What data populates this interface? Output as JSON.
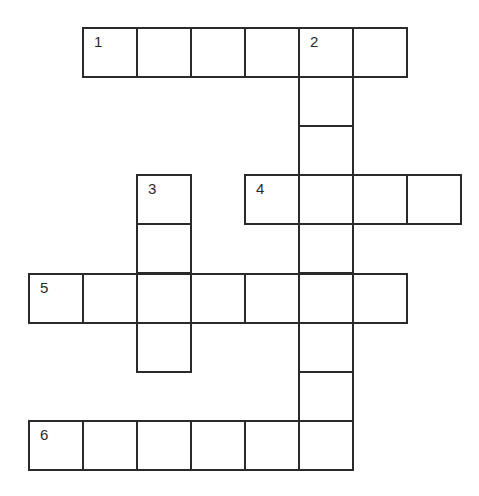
{
  "puzzle": {
    "type": "crossword",
    "layout": {
      "col_x": [
        28,
        82,
        136,
        190,
        244,
        298,
        352,
        406
      ],
      "row_y": [
        27,
        76,
        125,
        174,
        223,
        273,
        322,
        371,
        420
      ],
      "cell_w": 54,
      "cell_h": 49
    },
    "entries": [
      {
        "number": "1",
        "direction": "across",
        "row": 0,
        "col": 1,
        "length": 6
      },
      {
        "number": "2",
        "direction": "down",
        "row": 0,
        "col": 5,
        "length": 9
      },
      {
        "number": "3",
        "direction": "down",
        "row": 3,
        "col": 2,
        "length": 4
      },
      {
        "number": "4",
        "direction": "across",
        "row": 3,
        "col": 4,
        "length": 4
      },
      {
        "number": "5",
        "direction": "across",
        "row": 5,
        "col": 0,
        "length": 7
      },
      {
        "number": "6",
        "direction": "across",
        "row": 8,
        "col": 0,
        "length": 6
      }
    ],
    "cells": [
      {
        "row": 0,
        "col": 1,
        "number": "1",
        "value": ""
      },
      {
        "row": 0,
        "col": 2,
        "number": "",
        "value": ""
      },
      {
        "row": 0,
        "col": 3,
        "number": "",
        "value": ""
      },
      {
        "row": 0,
        "col": 4,
        "number": "",
        "value": ""
      },
      {
        "row": 0,
        "col": 5,
        "number": "2",
        "value": ""
      },
      {
        "row": 0,
        "col": 6,
        "number": "",
        "value": ""
      },
      {
        "row": 1,
        "col": 5,
        "number": "",
        "value": ""
      },
      {
        "row": 2,
        "col": 5,
        "number": "",
        "value": ""
      },
      {
        "row": 3,
        "col": 2,
        "number": "3",
        "value": ""
      },
      {
        "row": 3,
        "col": 4,
        "number": "4",
        "value": ""
      },
      {
        "row": 3,
        "col": 5,
        "number": "",
        "value": ""
      },
      {
        "row": 3,
        "col": 6,
        "number": "",
        "value": ""
      },
      {
        "row": 3,
        "col": 7,
        "number": "",
        "value": ""
      },
      {
        "row": 4,
        "col": 2,
        "number": "",
        "value": ""
      },
      {
        "row": 4,
        "col": 5,
        "number": "",
        "value": ""
      },
      {
        "row": 5,
        "col": 0,
        "number": "5",
        "value": ""
      },
      {
        "row": 5,
        "col": 1,
        "number": "",
        "value": ""
      },
      {
        "row": 5,
        "col": 2,
        "number": "",
        "value": ""
      },
      {
        "row": 5,
        "col": 3,
        "number": "",
        "value": ""
      },
      {
        "row": 5,
        "col": 4,
        "number": "",
        "value": ""
      },
      {
        "row": 5,
        "col": 5,
        "number": "",
        "value": ""
      },
      {
        "row": 5,
        "col": 6,
        "number": "",
        "value": ""
      },
      {
        "row": 6,
        "col": 2,
        "number": "",
        "value": ""
      },
      {
        "row": 6,
        "col": 5,
        "number": "",
        "value": ""
      },
      {
        "row": 7,
        "col": 5,
        "number": "",
        "value": ""
      },
      {
        "row": 8,
        "col": 0,
        "number": "6",
        "value": ""
      },
      {
        "row": 8,
        "col": 1,
        "number": "",
        "value": ""
      },
      {
        "row": 8,
        "col": 2,
        "number": "",
        "value": ""
      },
      {
        "row": 8,
        "col": 3,
        "number": "",
        "value": ""
      },
      {
        "row": 8,
        "col": 4,
        "number": "",
        "value": ""
      },
      {
        "row": 8,
        "col": 5,
        "number": "",
        "value": ""
      }
    ]
  }
}
